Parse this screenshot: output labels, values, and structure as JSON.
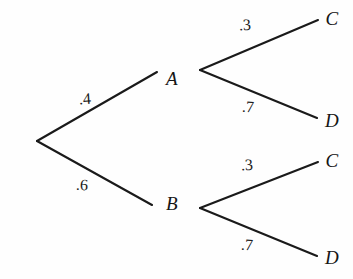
{
  "figure": {
    "kind": "probability-tree-diagram",
    "width": 353,
    "height": 279,
    "background_color": "#fefefe",
    "line_color": "#1a1a1a",
    "text_color": "#151515"
  },
  "nodes": {
    "root": {
      "id": "root",
      "label": "",
      "x": 37,
      "y": 141
    },
    "a": {
      "id": "A",
      "label": "A",
      "x": 172,
      "y": 78,
      "vertex_x": 200,
      "vertex_y": 70
    },
    "b": {
      "id": "B",
      "label": "B",
      "x": 172,
      "y": 203,
      "vertex_x": 200,
      "vertex_y": 208
    },
    "c_top": {
      "id": "C1",
      "label": "C",
      "x": 332,
      "y": 18
    },
    "d_top": {
      "id": "D1",
      "label": "D",
      "x": 332,
      "y": 120
    },
    "c_bottom": {
      "id": "C2",
      "label": "C",
      "x": 332,
      "y": 160
    },
    "d_bottom": {
      "id": "D2",
      "label": "D",
      "x": 332,
      "y": 257
    }
  },
  "edges": [
    {
      "id": "root-a",
      "from": "root",
      "to": "A",
      "label": ".4",
      "label_x": 85,
      "label_y": 99,
      "x1": 37,
      "y1": 141,
      "x2": 157,
      "y2": 72
    },
    {
      "id": "root-b",
      "from": "root",
      "to": "B",
      "label": ".6",
      "label_x": 82,
      "label_y": 185,
      "x1": 37,
      "y1": 141,
      "x2": 152,
      "y2": 205
    },
    {
      "id": "a-c",
      "from": "A",
      "to": "C1",
      "label": ".3",
      "label_x": 245,
      "label_y": 25,
      "x1": 200,
      "y1": 70,
      "x2": 318,
      "y2": 20
    },
    {
      "id": "a-d",
      "from": "A",
      "to": "D1",
      "label": ".7",
      "label_x": 248,
      "label_y": 107,
      "x1": 200,
      "y1": 70,
      "x2": 317,
      "y2": 118
    },
    {
      "id": "b-c",
      "from": "B",
      "to": "C2",
      "label": ".3",
      "label_x": 247,
      "label_y": 165,
      "x1": 200,
      "y1": 208,
      "x2": 318,
      "y2": 162
    },
    {
      "id": "b-d",
      "from": "B",
      "to": "D2",
      "label": ".7",
      "label_x": 247,
      "label_y": 245,
      "x1": 200,
      "y1": 208,
      "x2": 317,
      "y2": 256
    }
  ],
  "chart_data": {
    "type": "tree",
    "title": "",
    "xlabel": "",
    "ylabel": "",
    "stages": [
      {
        "stage": 1,
        "branches": [
          {
            "outcome": "A",
            "probability": 0.4,
            "label": ".4"
          },
          {
            "outcome": "B",
            "probability": 0.6,
            "label": ".6"
          }
        ]
      },
      {
        "stage": 2,
        "parent": "A",
        "branches": [
          {
            "outcome": "C",
            "probability": 0.3,
            "label": ".3"
          },
          {
            "outcome": "D",
            "probability": 0.7,
            "label": ".7"
          }
        ]
      },
      {
        "stage": 2,
        "parent": "B",
        "branches": [
          {
            "outcome": "C",
            "probability": 0.3,
            "label": ".3"
          },
          {
            "outcome": "D",
            "probability": 0.7,
            "label": ".7"
          }
        ]
      }
    ],
    "paths": [
      {
        "path": "A-C",
        "probability": 0.12
      },
      {
        "path": "A-D",
        "probability": 0.28
      },
      {
        "path": "B-C",
        "probability": 0.18
      },
      {
        "path": "B-D",
        "probability": 0.42
      }
    ]
  }
}
